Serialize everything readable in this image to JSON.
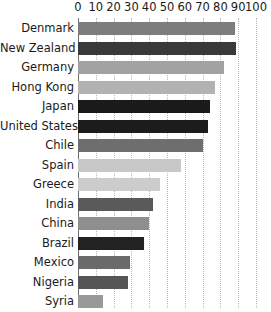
{
  "chart_data": {
    "type": "bar",
    "orientation": "horizontal",
    "title": "",
    "subtitle": "",
    "xlabel": "",
    "ylabel": "",
    "xlim": [
      0,
      100
    ],
    "grid": true,
    "legend": "none",
    "axis_position": "top",
    "tick_labels": [
      "0",
      "10",
      "20",
      "30",
      "40",
      "50",
      "60",
      "70",
      "80",
      "90",
      "100"
    ],
    "ticks": [
      0,
      10,
      20,
      30,
      40,
      50,
      60,
      70,
      80,
      90,
      100
    ],
    "categories": [
      "Denmark",
      "New Zealand",
      "Germany",
      "Hong Kong",
      "Japan",
      "United States",
      "Chile",
      "Spain",
      "Greece",
      "India",
      "China",
      "Brazil",
      "Mexico",
      "Nigeria",
      "Syria",
      "Somalia"
    ],
    "values": [
      88,
      89,
      82,
      77,
      74,
      73,
      70,
      58,
      46,
      42,
      40,
      37,
      29,
      28,
      14,
      11
    ],
    "bar_colors": [
      "#7d7d7d",
      "#3a3a3a",
      "#a2a2a2",
      "#b2b2b2",
      "#1a1a1a",
      "#1c1c1c",
      "#6e6e6e",
      "#c8c8c8",
      "#cccccc",
      "#5a5a5a",
      "#8f8f8f",
      "#222222",
      "#6a6a6a",
      "#555555",
      "#999999",
      "#111111"
    ],
    "gridline_color": "#b9b9b9",
    "axis_color": "#6d6d6d",
    "text_color": "#1a1a1a",
    "background": "#ffffff"
  }
}
